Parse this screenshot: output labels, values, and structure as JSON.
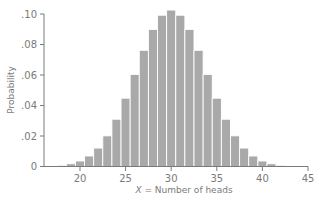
{
  "chart_data": {
    "type": "bar",
    "title": "",
    "xlabel": "X = Number of heads",
    "xlabel_var": "X",
    "xlabel_rest": " = Number of heads",
    "ylabel": "Probability",
    "xlim": [
      16.5,
      45
    ],
    "ylim": [
      0,
      0.1
    ],
    "grid": false,
    "legend": null,
    "x_ticks": [
      20,
      25,
      30,
      35,
      40,
      45
    ],
    "x_tick_labels": [
      "20",
      "25",
      "30",
      "35",
      "40",
      "45"
    ],
    "y_ticks": [
      0,
      0.02,
      0.04,
      0.06,
      0.08,
      0.1
    ],
    "y_tick_labels": [
      "0",
      ".02",
      ".04",
      ".06",
      ".08",
      ".10"
    ],
    "categories": [
      17,
      18,
      19,
      20,
      21,
      22,
      23,
      24,
      25,
      26,
      27,
      28,
      29,
      30,
      31,
      32,
      33,
      34,
      35,
      36,
      37,
      38,
      39,
      40,
      41,
      42,
      43
    ],
    "values": [
      0.0003,
      0.0008,
      0.0018,
      0.0036,
      0.0069,
      0.0121,
      0.0201,
      0.031,
      0.0448,
      0.0604,
      0.0762,
      0.0899,
      0.0992,
      0.1026,
      0.0992,
      0.0899,
      0.0762,
      0.0604,
      0.0448,
      0.031,
      0.0201,
      0.0121,
      0.0069,
      0.0036,
      0.0018,
      0.0008,
      0.0003
    ],
    "colors": {
      "bar": "#a9a9a9",
      "bar_separator": "#ffffff",
      "axis": "#7a7a7a",
      "text": "#7a7a7a"
    }
  }
}
